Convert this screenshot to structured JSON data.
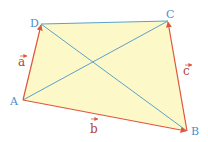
{
  "diagram": {
    "type": "quadrilateral-vectors",
    "vertices": {
      "A": {
        "label": "A",
        "x": 23,
        "y": 100,
        "label_x": 10,
        "label_y": 105
      },
      "B": {
        "label": "B",
        "x": 187,
        "y": 131,
        "label_x": 191,
        "label_y": 135
      },
      "C": {
        "label": "C",
        "x": 168,
        "y": 21,
        "label_x": 167,
        "label_y": 17
      },
      "D": {
        "label": "D",
        "x": 41,
        "y": 24,
        "label_x": 30,
        "label_y": 26
      }
    },
    "vectors": [
      {
        "name": "a",
        "label": "a",
        "from": "A",
        "to": "D",
        "label_x": 18,
        "label_y": 66
      },
      {
        "name": "b",
        "label": "b",
        "from": "A",
        "to": "B",
        "label_x": 90,
        "label_y": 133
      },
      {
        "name": "c",
        "label": "c",
        "from": "B",
        "to": "C",
        "label_x": 183,
        "label_y": 75
      }
    ],
    "plain_edges": [
      {
        "from": "D",
        "to": "C"
      }
    ],
    "diagonals": [
      {
        "from": "A",
        "to": "C"
      },
      {
        "from": "D",
        "to": "B"
      }
    ],
    "colors": {
      "fill": "#fdf8c8",
      "vector_edge": "#e0553a",
      "plain_edge": "#5ea0c8",
      "diagonal": "#5ea0c8",
      "vertex_label": "#4a90c8",
      "vector_label": "#b0443a"
    }
  }
}
